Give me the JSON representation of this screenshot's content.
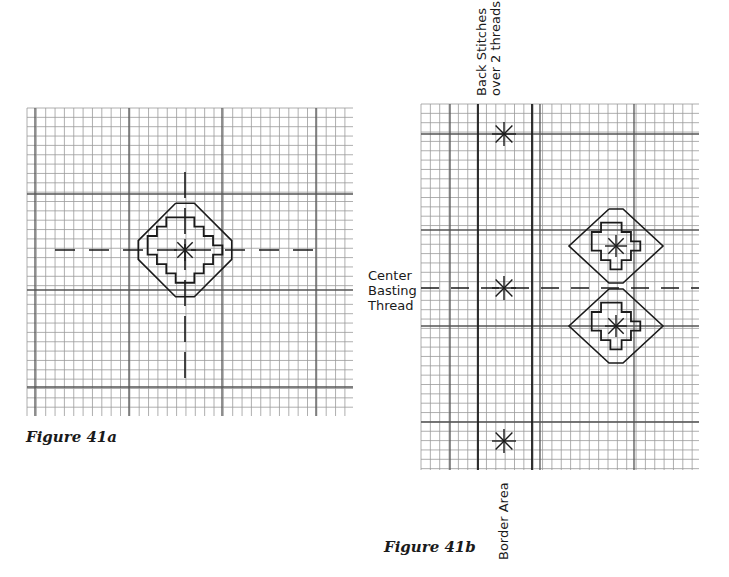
{
  "figure_a": {
    "caption": "Figure 41a",
    "grid": {
      "x0": 27,
      "y0": 108,
      "x1": 353,
      "y1": 416,
      "cell": 9.35
    },
    "motif": "stepped diamond with octagonal outline and star stitch center"
  },
  "figure_b": {
    "caption": "Figure 41b",
    "grid": {
      "x0": 421,
      "y0": 104,
      "x1": 699,
      "y1": 470,
      "cell": 9.35
    },
    "labels": {
      "back_stitches_line1": "Back Stitches",
      "back_stitches_line2": "over 2 threads",
      "center_line1": "Center",
      "center_line2": "Basting",
      "center_line3": "Thread",
      "border_area": "Border Area"
    },
    "motif": "two stacked stepped diamonds with star stitch centers; star stitches in border area"
  },
  "colors": {
    "ink": "#1a1a1a",
    "grid": "#9a9a9a",
    "grid_bold": "#555555"
  }
}
